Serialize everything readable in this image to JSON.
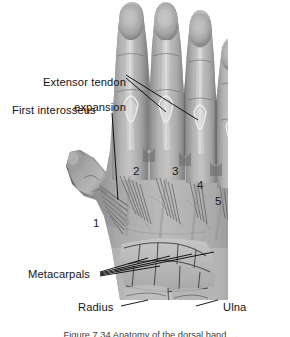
{
  "figure": {
    "kind": "anatomical-dissection-photograph",
    "background_color": "#ffffff",
    "line_color": "#000000",
    "text_color": "#141414",
    "photo_bounds": {
      "x": 62,
      "y": 0,
      "width": 165,
      "height": 322
    }
  },
  "labels": [
    {
      "id": "extensor-tendon-expansion",
      "line1": "Extensor tendon",
      "line2": "expansion",
      "x": 14,
      "y": 63,
      "align": "right"
    },
    {
      "id": "first-interosseus",
      "line1": "First interosseus",
      "line2": "",
      "x": 12,
      "y": 104,
      "align": "left"
    },
    {
      "id": "metacarpals",
      "line1": "Metacarpals",
      "line2": "",
      "x": 28,
      "y": 268,
      "align": "left"
    },
    {
      "id": "radius",
      "line1": "Radius",
      "line2": "",
      "x": 78,
      "y": 301,
      "align": "left"
    },
    {
      "id": "ulna",
      "line1": "Ulna",
      "line2": "",
      "x": 223,
      "y": 301,
      "align": "left"
    }
  ],
  "digit_numbers": [
    {
      "id": "digit-1",
      "value": "1",
      "x": 93,
      "y": 218
    },
    {
      "id": "digit-2",
      "value": "2",
      "x": 133,
      "y": 166
    },
    {
      "id": "digit-3",
      "value": "3",
      "x": 172,
      "y": 166
    },
    {
      "id": "digit-4",
      "value": "4",
      "x": 197,
      "y": 180
    },
    {
      "id": "digit-5",
      "value": "5",
      "x": 215,
      "y": 196
    }
  ],
  "caption": {
    "text": "Figure 7.34  Anatomy of the dorsal hand",
    "clipped": true
  }
}
